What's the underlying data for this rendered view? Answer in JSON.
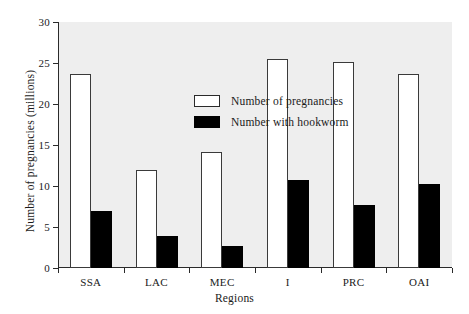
{
  "chart_data": {
    "type": "bar",
    "title": "",
    "subtitle": "",
    "xlabel": "Regions",
    "ylabel": "Number of pregnancies (millions)",
    "categories": [
      "SSA",
      "LAC",
      "MEC",
      "I",
      "PRC",
      "OAI"
    ],
    "series": [
      {
        "name": "Number of pregnancies",
        "values": [
          23.6,
          11.9,
          14.1,
          25.5,
          25.1,
          23.6
        ],
        "color": "#ffffff",
        "edge_color": "#3a3a3a",
        "style": "open"
      },
      {
        "name": "Number with hookworm",
        "values": [
          6.9,
          3.9,
          2.7,
          10.7,
          7.7,
          10.2
        ],
        "color": "#000000",
        "edge_color": "#000000",
        "style": "filled"
      }
    ],
    "ylim": [
      0,
      30
    ],
    "yticks": [
      0,
      5,
      10,
      15,
      20,
      25,
      30
    ],
    "ytick_labels": [
      "0",
      "5",
      "10",
      "15",
      "20",
      "25",
      "30"
    ],
    "grid": false,
    "legend_position": "upper-center-left",
    "plot_background": "#eeeeee",
    "figure_background": "#ffffff",
    "axis_color": "#2a2a2a"
  },
  "legend": {
    "entries": [
      {
        "label": "Number of pregnancies",
        "swatch": "open-rect-icon"
      },
      {
        "label": "Number with hookworm",
        "swatch": "filled-rect-icon"
      }
    ]
  },
  "axes": {
    "y_title": "Number of pregnancies (millions)",
    "x_title": "Regions"
  }
}
